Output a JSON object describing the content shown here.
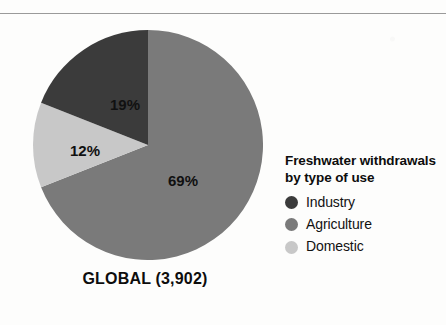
{
  "figure": {
    "caption": "GLOBAL (3,902)",
    "has_top_rule": true
  },
  "legend": {
    "title_line1": "Freshwater withdrawals",
    "title_line2": "by type of use",
    "items": [
      {
        "label": "Industry",
        "color": "#3b3b3b",
        "swatch_icon": "circle-swatch-icon"
      },
      {
        "label": "Agriculture",
        "color": "#7a7a7a",
        "swatch_icon": "circle-swatch-icon"
      },
      {
        "label": "Domestic",
        "color": "#c8c8c8",
        "swatch_icon": "circle-swatch-icon"
      }
    ]
  },
  "chart_data": {
    "type": "pie",
    "title": "GLOBAL (3,902)",
    "subtitle": "Freshwater withdrawals by type of use",
    "total": 3902,
    "total_label": "3,902",
    "unit_note": "",
    "categories": [
      "Agriculture",
      "Domestic",
      "Industry"
    ],
    "values": [
      69,
      12,
      19
    ],
    "data_labels": [
      "69%",
      "12%",
      "19%"
    ],
    "colors": [
      "#7a7a7a",
      "#c8c8c8",
      "#3b3b3b"
    ],
    "start_angle_deg": 0,
    "direction": "clockwise",
    "legend_position": "right",
    "legend_order": [
      "Industry",
      "Agriculture",
      "Domestic"
    ],
    "grid": false,
    "xlabel": "",
    "ylabel": "",
    "slices": [
      {
        "name": "Agriculture",
        "percent": 69,
        "label": "69%",
        "color": "#7a7a7a",
        "label_x": 150,
        "label_y": 150
      },
      {
        "name": "Domestic",
        "percent": 12,
        "label": "12%",
        "color": "#c8c8c8",
        "label_x": 52,
        "label_y": 120
      },
      {
        "name": "Industry",
        "percent": 19,
        "label": "19%",
        "color": "#3b3b3b",
        "label_x": 92,
        "label_y": 74
      }
    ]
  }
}
